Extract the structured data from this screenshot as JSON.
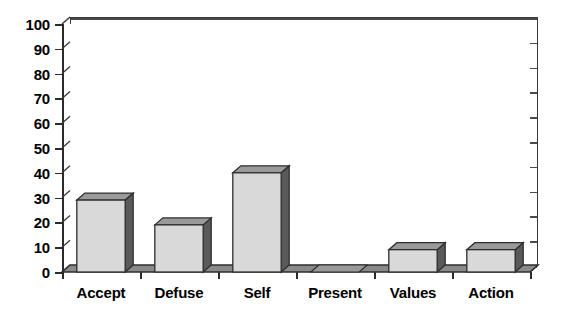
{
  "chart_data": {
    "type": "bar",
    "title": "",
    "subtitle": "",
    "xlabel": "",
    "ylabel": "",
    "categories": [
      "Accept",
      "Defuse",
      "Self",
      "Present",
      "Values",
      "Action"
    ],
    "values": [
      29,
      19,
      40,
      0,
      9,
      9
    ],
    "ylim": [
      0,
      100
    ],
    "yticks": [
      0,
      10,
      20,
      30,
      40,
      50,
      60,
      70,
      80,
      90,
      100
    ],
    "ytick_labels": [
      "0",
      "10",
      "20",
      "30",
      "40",
      "50",
      "60",
      "70",
      "80",
      "90",
      "100"
    ],
    "grid": true,
    "grid_axis": "y",
    "legend": false,
    "legend_position": "none",
    "style": "3d-column",
    "colors": {
      "bar_front": "#d9d9d9",
      "bar_side": "#5a5a5a",
      "bar_top": "#9a9a9a",
      "bar_outline": "#2e2e2e",
      "axis": "#2b2b2b",
      "gridline": "#4a4a4a",
      "floor": "#8a8a8a",
      "background": "#ffffff",
      "text": "#000000"
    }
  }
}
